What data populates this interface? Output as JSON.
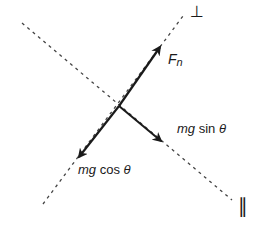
{
  "diagram": {
    "type": "free-body force components on incline",
    "colors": {
      "line": "#1a1a1a",
      "dash": "#444444",
      "background": "#ffffff"
    },
    "axes": {
      "perpendicular_label": "⊥",
      "parallel_label": "∥"
    },
    "forces": [
      {
        "id": "normal",
        "label_main": "F",
        "label_sub": "n",
        "direction": "up-right, perpendicular to incline"
      },
      {
        "id": "gravity_perp",
        "label_var": "mg",
        "label_fn": "cos",
        "label_angle": "θ",
        "direction": "down-left, perpendicular into incline"
      },
      {
        "id": "gravity_par",
        "label_var": "mg",
        "label_fn": "sin",
        "label_angle": "θ",
        "direction": "down-right, parallel along incline"
      }
    ]
  }
}
